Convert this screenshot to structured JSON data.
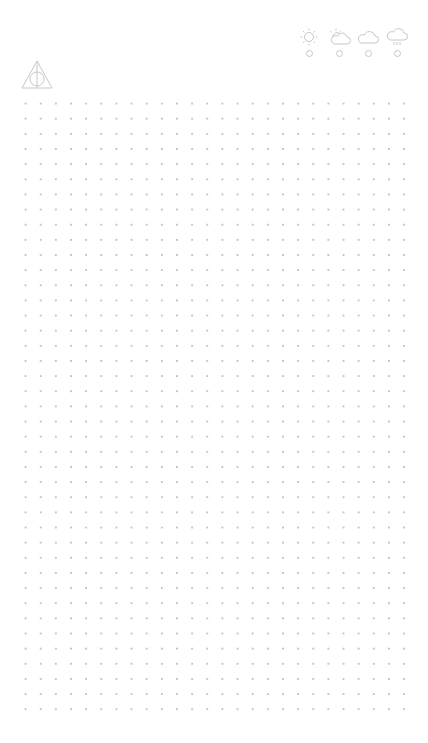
{
  "logo": {
    "icon": "deathly-hallows-icon",
    "color": "#c8c8c8"
  },
  "weather": {
    "options": [
      {
        "name": "sunny",
        "icon": "sun-icon",
        "selected": false
      },
      {
        "name": "partly-cloudy",
        "icon": "sun-cloud-icon",
        "selected": false
      },
      {
        "name": "cloudy",
        "icon": "cloud-icon",
        "selected": false
      },
      {
        "name": "rainy",
        "icon": "rain-cloud-icon",
        "selected": false
      }
    ],
    "icon_color": "#c8c8c8"
  },
  "page": {
    "style": "dot-grid",
    "dot_color": "#c4c4c4",
    "spacing_px": 15
  }
}
